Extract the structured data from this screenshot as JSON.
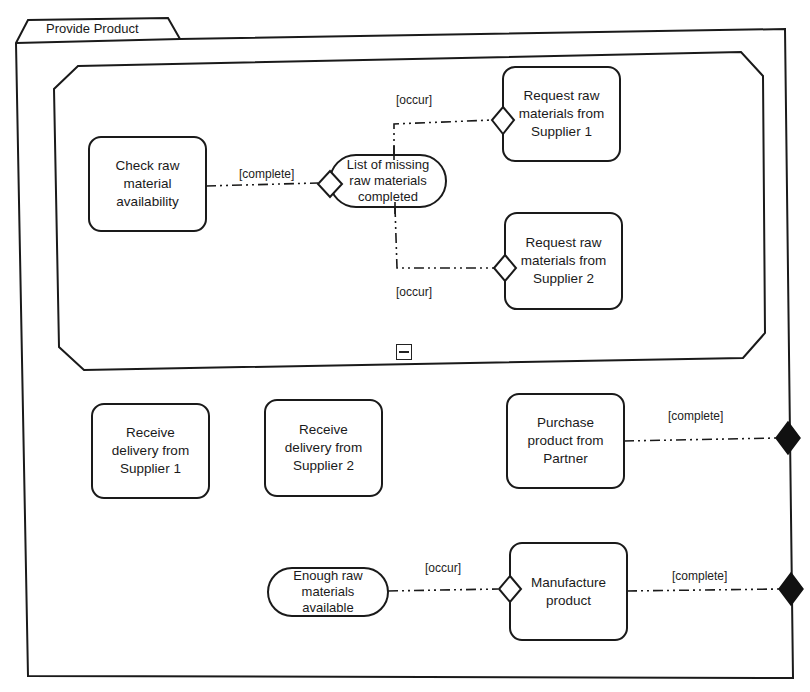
{
  "diagram": {
    "title": "Provide Product",
    "inner_region": {
      "nodes": {
        "check": "Check raw\nmaterial\navailability",
        "missing_state": "List of missing\nraw materials\ncompleted",
        "req1": "Request raw\nmaterials from\nSupplier 1",
        "req2": "Request raw\nmaterials from\nSupplier 2"
      },
      "guards": {
        "check_to_state": "[complete]",
        "state_to_req1": "[occur]",
        "state_to_req2": "[occur]"
      },
      "collapse_icon": "minus-box-icon"
    },
    "outer_nodes": {
      "recv1": "Receive\ndelivery from\nSupplier 1",
      "recv2": "Receive\ndelivery from\nSupplier 2",
      "purchase": "Purchase\nproduct from\nPartner",
      "enough_state": "Enough raw\nmaterials\navailable",
      "manufacture": "Manufacture\nproduct"
    },
    "outer_guards": {
      "purchase_to_merge": "[complete]",
      "enough_to_manufacture": "[occur]",
      "manufacture_to_merge": "[complete]"
    },
    "colors": {
      "stroke": "#1a1a1a",
      "fill": "#ffffff",
      "filled_diamond": "#111111"
    }
  }
}
